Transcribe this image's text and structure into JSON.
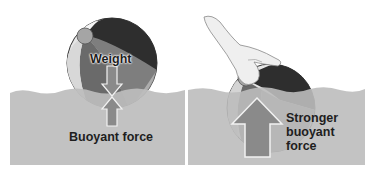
{
  "diagram": {
    "left_panel": {
      "ball_label": "Weight",
      "water_label": "Buoyant force"
    },
    "right_panel": {
      "water_label_lines": [
        "Stronger",
        "buoyant",
        "force"
      ]
    },
    "colors": {
      "water": "#bdbdbd",
      "arrow": "#8a8a8a",
      "ball_dark": "#2e2e2e",
      "ball_mid": "#777777",
      "ball_light": "#e8e8e8",
      "text": "#1e1e1e"
    }
  }
}
